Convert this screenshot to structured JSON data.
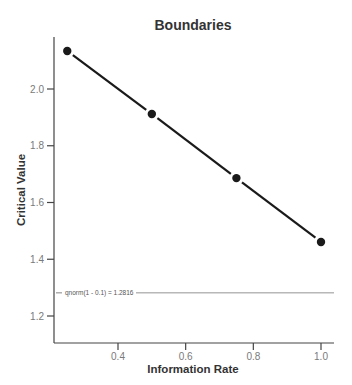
{
  "chart_data": {
    "type": "line",
    "title": "Boundaries",
    "xlabel": "Information Rate",
    "ylabel": "Critical Value",
    "x": [
      0.25,
      0.5,
      0.75,
      1.0
    ],
    "series": [
      {
        "name": "Critical Value",
        "values": [
          2.134,
          1.912,
          1.686,
          1.461
        ],
        "color": "#1a1a1a"
      }
    ],
    "reference_line": {
      "y": 1.2816,
      "label": "qnorm(1 - 0.1) = 1.2816",
      "color": "#555555"
    },
    "xticks": [
      0.4,
      0.6,
      0.8,
      1.0
    ],
    "xtick_labels": [
      "0.4",
      "0.6",
      "0.8",
      "1.0"
    ],
    "yticks": [
      1.2,
      1.4,
      1.6,
      1.8,
      2.0
    ],
    "ytick_labels": [
      "1.2",
      "1.4",
      "1.6",
      "1.8",
      "2.0"
    ],
    "xlim": [
      0.2,
      1.04
    ],
    "ylim": [
      1.09,
      2.19
    ],
    "grid": false,
    "legend": "none"
  }
}
